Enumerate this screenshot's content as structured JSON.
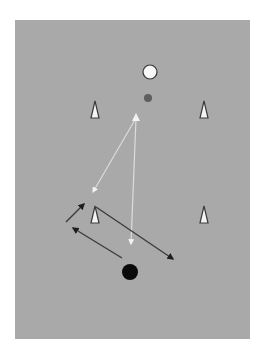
{
  "diagram": {
    "type": "soccer-drill",
    "colors": {
      "page_bg": "#ffffff",
      "field": "#a9a9a9",
      "cone_fill": "#f4f4f4",
      "cone_stroke": "#3a3a3a",
      "ball_white": "#f8f8f8",
      "ball_grey": "#5e5e5e",
      "player_black": "#0a0a0a",
      "pass_line": "#dcdcdc",
      "run_line": "#3c3c3c"
    },
    "field": {
      "x": 15,
      "y": 20,
      "w": 235,
      "h": 319
    },
    "cones": [
      {
        "id": "cone-top-left",
        "x": 95,
        "y": 101
      },
      {
        "id": "cone-top-right",
        "x": 204,
        "y": 101
      },
      {
        "id": "cone-bottom-left",
        "x": 95,
        "y": 206
      },
      {
        "id": "cone-bottom-right",
        "x": 204,
        "y": 206
      }
    ],
    "markers": [
      {
        "id": "white-ball",
        "x": 150,
        "y": 72,
        "r": 7
      },
      {
        "id": "grey-marker",
        "x": 148,
        "y": 98,
        "r": 4
      },
      {
        "id": "black-player",
        "x": 130,
        "y": 272,
        "r": 8
      }
    ],
    "passes": [
      {
        "id": "pass-diagonal",
        "x1": 136,
        "y1": 118,
        "x2": 93,
        "y2": 192
      },
      {
        "id": "pass-vertical",
        "x1": 136,
        "y1": 118,
        "x2": 131,
        "y2": 244
      }
    ],
    "runs": [
      {
        "id": "run-short",
        "x1": 66,
        "y1": 222,
        "x2": 84,
        "y2": 204
      },
      {
        "id": "run-back",
        "x1": 122,
        "y1": 258,
        "x2": 73,
        "y2": 228
      },
      {
        "id": "run-long",
        "x1": 96,
        "y1": 207,
        "x2": 173,
        "y2": 259
      }
    ]
  }
}
